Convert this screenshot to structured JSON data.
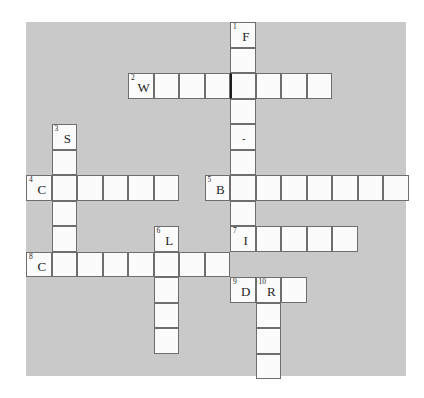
{
  "puzzle": {
    "kind": "crossword-grid",
    "title": "",
    "cell_size": 25.5,
    "origin": {
      "x": 26,
      "y": 22
    },
    "colors": {
      "board_background": "#c9c9c9",
      "cell_fill": "#fbfbfb",
      "cell_border": "#6e6e6e",
      "accent_border": "#1c1c1c",
      "text": "#1f1f1f",
      "page_background": "#ffffff"
    },
    "board": {
      "left": 26,
      "top": 22,
      "width": 380,
      "height": 354
    },
    "entries": [
      {
        "number": "1",
        "direction": "down",
        "start_col": 8,
        "start_row": 0,
        "length": 10,
        "first_letter": "F"
      },
      {
        "number": "2",
        "direction": "across",
        "start_col": 4,
        "start_row": 2,
        "length": 8,
        "first_letter": "W"
      },
      {
        "number": "3",
        "direction": "down",
        "start_col": 1,
        "start_row": 4,
        "length": 6,
        "first_letter": "S"
      },
      {
        "number": "4",
        "direction": "across",
        "start_col": 0,
        "start_row": 6,
        "length": 6,
        "first_letter": "C"
      },
      {
        "number": "5",
        "direction": "across",
        "start_col": 7,
        "start_row": 6,
        "length": 8,
        "first_letter": "B"
      },
      {
        "number": "6",
        "direction": "down",
        "start_col": 5,
        "start_row": 8,
        "length": 5,
        "first_letter": "L"
      },
      {
        "number": "7",
        "direction": "across",
        "start_col": 8,
        "start_row": 8,
        "length": 5,
        "first_letter": "I"
      },
      {
        "number": "8",
        "direction": "across",
        "start_col": 0,
        "start_row": 9,
        "length": 8,
        "first_letter": "C"
      },
      {
        "number": "9",
        "direction": "across",
        "start_col": 8,
        "start_row": 10,
        "length": 3,
        "first_letter": "D"
      },
      {
        "number": "10",
        "direction": "down",
        "start_col": 9,
        "start_row": 10,
        "length": 4,
        "first_letter": "R"
      }
    ],
    "cells": [
      {
        "id": "c-8-0",
        "col": 8,
        "row": 0,
        "number": "1",
        "letter": "F",
        "dark_left": false
      },
      {
        "id": "c-8-1",
        "col": 8,
        "row": 1,
        "number": "",
        "letter": "",
        "dark_left": false
      },
      {
        "id": "c-4-2",
        "col": 4,
        "row": 2,
        "number": "2",
        "letter": "W",
        "dark_left": false
      },
      {
        "id": "c-5-2",
        "col": 5,
        "row": 2,
        "number": "",
        "letter": "",
        "dark_left": false
      },
      {
        "id": "c-6-2",
        "col": 6,
        "row": 2,
        "number": "",
        "letter": "",
        "dark_left": false
      },
      {
        "id": "c-7-2",
        "col": 7,
        "row": 2,
        "number": "",
        "letter": "",
        "dark_left": false
      },
      {
        "id": "c-8-2",
        "col": 8,
        "row": 2,
        "number": "",
        "letter": "",
        "dark_left": true
      },
      {
        "id": "c-9-2",
        "col": 9,
        "row": 2,
        "number": "",
        "letter": "",
        "dark_left": false
      },
      {
        "id": "c-10-2",
        "col": 10,
        "row": 2,
        "number": "",
        "letter": "",
        "dark_left": false
      },
      {
        "id": "c-11-2",
        "col": 11,
        "row": 2,
        "number": "",
        "letter": "",
        "dark_left": false
      },
      {
        "id": "c-8-3",
        "col": 8,
        "row": 3,
        "number": "",
        "letter": "",
        "dark_left": false
      },
      {
        "id": "c-1-4",
        "col": 1,
        "row": 4,
        "number": "3",
        "letter": "S",
        "dark_left": false
      },
      {
        "id": "c-8-4",
        "col": 8,
        "row": 4,
        "number": "",
        "letter": "-",
        "dark_left": false
      },
      {
        "id": "c-1-5",
        "col": 1,
        "row": 5,
        "number": "",
        "letter": "",
        "dark_left": false
      },
      {
        "id": "c-8-5",
        "col": 8,
        "row": 5,
        "number": "",
        "letter": "",
        "dark_left": false
      },
      {
        "id": "c-0-6",
        "col": 0,
        "row": 6,
        "number": "4",
        "letter": "C",
        "dark_left": false
      },
      {
        "id": "c-1-6",
        "col": 1,
        "row": 6,
        "number": "",
        "letter": "",
        "dark_left": false
      },
      {
        "id": "c-2-6",
        "col": 2,
        "row": 6,
        "number": "",
        "letter": "",
        "dark_left": false
      },
      {
        "id": "c-3-6",
        "col": 3,
        "row": 6,
        "number": "",
        "letter": "",
        "dark_left": false
      },
      {
        "id": "c-4-6",
        "col": 4,
        "row": 6,
        "number": "",
        "letter": "",
        "dark_left": false
      },
      {
        "id": "c-5-6",
        "col": 5,
        "row": 6,
        "number": "",
        "letter": "",
        "dark_left": false
      },
      {
        "id": "c-7-6",
        "col": 7,
        "row": 6,
        "number": "5",
        "letter": "B",
        "dark_left": false
      },
      {
        "id": "c-8-6",
        "col": 8,
        "row": 6,
        "number": "",
        "letter": "",
        "dark_left": false
      },
      {
        "id": "c-9-6",
        "col": 9,
        "row": 6,
        "number": "",
        "letter": "",
        "dark_left": false
      },
      {
        "id": "c-10-6",
        "col": 10,
        "row": 6,
        "number": "",
        "letter": "",
        "dark_left": false
      },
      {
        "id": "c-11-6",
        "col": 11,
        "row": 6,
        "number": "",
        "letter": "",
        "dark_left": false
      },
      {
        "id": "c-12-6",
        "col": 12,
        "row": 6,
        "number": "",
        "letter": "",
        "dark_left": false
      },
      {
        "id": "c-13-6",
        "col": 13,
        "row": 6,
        "number": "",
        "letter": "",
        "dark_left": false
      },
      {
        "id": "c-14-6",
        "col": 14,
        "row": 6,
        "number": "",
        "letter": "",
        "dark_left": false
      },
      {
        "id": "c-1-7",
        "col": 1,
        "row": 7,
        "number": "",
        "letter": "",
        "dark_left": false
      },
      {
        "id": "c-8-7",
        "col": 8,
        "row": 7,
        "number": "",
        "letter": "",
        "dark_left": false
      },
      {
        "id": "c-1-8",
        "col": 1,
        "row": 8,
        "number": "",
        "letter": "",
        "dark_left": false
      },
      {
        "id": "c-5-8",
        "col": 5,
        "row": 8,
        "number": "6",
        "letter": "L",
        "dark_left": false
      },
      {
        "id": "c-8-8",
        "col": 8,
        "row": 8,
        "number": "7",
        "letter": "I",
        "dark_left": false
      },
      {
        "id": "c-9-8",
        "col": 9,
        "row": 8,
        "number": "",
        "letter": "",
        "dark_left": false
      },
      {
        "id": "c-10-8",
        "col": 10,
        "row": 8,
        "number": "",
        "letter": "",
        "dark_left": false
      },
      {
        "id": "c-11-8",
        "col": 11,
        "row": 8,
        "number": "",
        "letter": "",
        "dark_left": false
      },
      {
        "id": "c-12-8",
        "col": 12,
        "row": 8,
        "number": "",
        "letter": "",
        "dark_left": false
      },
      {
        "id": "c-0-9",
        "col": 0,
        "row": 9,
        "number": "8",
        "letter": "C",
        "dark_left": false
      },
      {
        "id": "c-1-9",
        "col": 1,
        "row": 9,
        "number": "",
        "letter": "",
        "dark_left": false
      },
      {
        "id": "c-2-9",
        "col": 2,
        "row": 9,
        "number": "",
        "letter": "",
        "dark_left": false
      },
      {
        "id": "c-3-9",
        "col": 3,
        "row": 9,
        "number": "",
        "letter": "",
        "dark_left": false
      },
      {
        "id": "c-4-9",
        "col": 4,
        "row": 9,
        "number": "",
        "letter": "",
        "dark_left": false
      },
      {
        "id": "c-5-9",
        "col": 5,
        "row": 9,
        "number": "",
        "letter": "",
        "dark_left": false
      },
      {
        "id": "c-6-9",
        "col": 6,
        "row": 9,
        "number": "",
        "letter": "",
        "dark_left": false
      },
      {
        "id": "c-7-9",
        "col": 7,
        "row": 9,
        "number": "",
        "letter": "",
        "dark_left": false
      },
      {
        "id": "c-8-10",
        "col": 8,
        "row": 10,
        "number": "9",
        "letter": "D",
        "dark_left": false
      },
      {
        "id": "c-9-10",
        "col": 9,
        "row": 10,
        "number": "10",
        "letter": "R",
        "dark_left": false
      },
      {
        "id": "c-10-10",
        "col": 10,
        "row": 10,
        "number": "",
        "letter": "",
        "dark_left": false
      },
      {
        "id": "c-5-10",
        "col": 5,
        "row": 10,
        "number": "",
        "letter": "",
        "dark_left": false
      },
      {
        "id": "c-5-11",
        "col": 5,
        "row": 11,
        "number": "",
        "letter": "",
        "dark_left": false
      },
      {
        "id": "c-9-11",
        "col": 9,
        "row": 11,
        "number": "",
        "letter": "",
        "dark_left": false
      },
      {
        "id": "c-5-12",
        "col": 5,
        "row": 12,
        "number": "",
        "letter": "",
        "dark_left": false
      },
      {
        "id": "c-9-12",
        "col": 9,
        "row": 12,
        "number": "",
        "letter": "",
        "dark_left": false
      },
      {
        "id": "c-9-13",
        "col": 9,
        "row": 13,
        "number": "",
        "letter": "",
        "dark_left": false
      }
    ]
  }
}
